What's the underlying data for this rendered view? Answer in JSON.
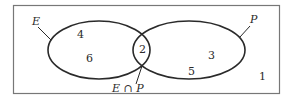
{
  "diagram": {
    "type": "venn",
    "universe": {
      "label": "",
      "outside_value": "1"
    },
    "sets": [
      {
        "id": "E",
        "label": "E",
        "only_values": [
          "4",
          "6"
        ]
      },
      {
        "id": "P",
        "label": "P",
        "only_values": [
          "3",
          "5"
        ]
      }
    ],
    "intersection": {
      "label": "E ∩ P",
      "values": [
        "2"
      ]
    },
    "colors": {
      "stroke": "#2a2a2a",
      "frame": "#777777",
      "background": "#ffffff"
    }
  }
}
